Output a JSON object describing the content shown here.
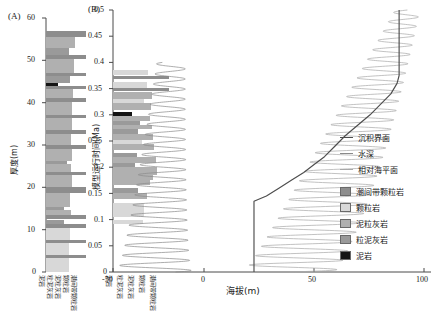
{
  "figure": {
    "panel_a": {
      "tag": "(A)",
      "ylabel": "厚度(m)",
      "yticks": [
        "0",
        "10",
        "20",
        "30",
        "40",
        "50",
        "60"
      ],
      "ylim": [
        0,
        60
      ],
      "bottom_labels": [
        "泥岩",
        "粒泥灰岩",
        "泥粒灰岩",
        "颗粒岩",
        "潮间带颗粒岩"
      ]
    },
    "panel_b": {
      "tag": "(B)",
      "ylabel": "模型运行时间(Ma)",
      "yticks": [
        "0",
        "0.05",
        "0.1",
        "0.15",
        "0.2",
        "0.25",
        "0.3",
        "0.35",
        "0.4",
        "0.45",
        "0.5"
      ],
      "ylim": [
        0,
        0.5
      ],
      "xlabel": "海拔(m)",
      "xticks": [
        "-50",
        "0",
        "50",
        "100"
      ],
      "xlim": [
        -50,
        100
      ],
      "bottom_labels": [
        "泥岩",
        "粒泥灰岩",
        "泥粒灰岩",
        "颗粒岩",
        "潮间带颗粒岩"
      ]
    },
    "legend": {
      "lines": [
        {
          "name": "sedimentary-interface",
          "label": "沉积界面",
          "color": "#4d4d4d"
        },
        {
          "name": "water-depth",
          "label": "水深",
          "color": "#8a8a8a"
        },
        {
          "name": "relative-sea-level",
          "label": "相对海平面",
          "color": "#a8a8a8"
        }
      ],
      "swatches": [
        {
          "name": "intertidal-grainstone",
          "label": "潮间带颗粒岩",
          "color": "#8d8d8d"
        },
        {
          "name": "grainstone",
          "label": "颗粒岩",
          "color": "#d8d8d8"
        },
        {
          "name": "packstone",
          "label": "泥粒灰岩",
          "color": "#b0b0b0"
        },
        {
          "name": "wackestone",
          "label": "粒泥灰岩",
          "color": "#9a9a9a"
        },
        {
          "name": "mudstone",
          "label": "泥岩",
          "color": "#141414"
        }
      ]
    }
  },
  "chart_data": {
    "type": "line",
    "title": "",
    "panels": [
      {
        "id": "A",
        "type": "lithology-column",
        "ylabel": "厚度(m)",
        "ylim": [
          0,
          60
        ],
        "xlabel": "",
        "description": "Stratigraphic thickness column of carbonate lithofacies versus thickness in metres.",
        "beds": [
          {
            "top": 57.0,
            "bottom": 55.5,
            "facies": "intertidal-grainstone",
            "width": 1.0
          },
          {
            "top": 55.5,
            "bottom": 53.0,
            "facies": "packstone",
            "width": 0.72
          },
          {
            "top": 53.0,
            "bottom": 51.2,
            "facies": "wackestone",
            "width": 0.58
          },
          {
            "top": 51.2,
            "bottom": 50.4,
            "facies": "intertidal-grainstone",
            "width": 1.0
          },
          {
            "top": 50.4,
            "bottom": 47.0,
            "facies": "packstone",
            "width": 0.7
          },
          {
            "top": 47.0,
            "bottom": 46.2,
            "facies": "intertidal-grainstone",
            "width": 1.0
          },
          {
            "top": 46.2,
            "bottom": 44.6,
            "facies": "wackestone",
            "width": 0.6
          },
          {
            "top": 44.6,
            "bottom": 44.0,
            "facies": "mudstone",
            "width": 0.3
          },
          {
            "top": 44.0,
            "bottom": 43.2,
            "facies": "intertidal-grainstone",
            "width": 1.0
          },
          {
            "top": 43.2,
            "bottom": 41.0,
            "facies": "packstone",
            "width": 0.68
          },
          {
            "top": 41.0,
            "bottom": 40.2,
            "facies": "intertidal-grainstone",
            "width": 1.0
          },
          {
            "top": 40.2,
            "bottom": 37.2,
            "facies": "packstone",
            "width": 0.66
          },
          {
            "top": 37.2,
            "bottom": 36.4,
            "facies": "intertidal-grainstone",
            "width": 1.0
          },
          {
            "top": 36.4,
            "bottom": 33.6,
            "facies": "packstone",
            "width": 0.64
          },
          {
            "top": 33.6,
            "bottom": 32.6,
            "facies": "intertidal-grainstone",
            "width": 1.0
          },
          {
            "top": 32.6,
            "bottom": 30.0,
            "facies": "packstone",
            "width": 0.62
          },
          {
            "top": 30.0,
            "bottom": 29.0,
            "facies": "intertidal-grainstone",
            "width": 1.0
          },
          {
            "top": 29.0,
            "bottom": 26.2,
            "facies": "packstone",
            "width": 0.66
          },
          {
            "top": 26.2,
            "bottom": 25.4,
            "facies": "wackestone",
            "width": 0.52
          },
          {
            "top": 25.4,
            "bottom": 23.6,
            "facies": "packstone",
            "width": 0.62
          },
          {
            "top": 23.6,
            "bottom": 22.8,
            "facies": "intertidal-grainstone",
            "width": 1.0
          },
          {
            "top": 22.8,
            "bottom": 20.0,
            "facies": "packstone",
            "width": 0.64
          },
          {
            "top": 20.0,
            "bottom": 18.6,
            "facies": "intertidal-grainstone",
            "width": 1.0
          },
          {
            "top": 18.6,
            "bottom": 15.4,
            "facies": "packstone",
            "width": 0.6
          },
          {
            "top": 15.4,
            "bottom": 14.6,
            "facies": "wackestone",
            "width": 0.46
          },
          {
            "top": 14.6,
            "bottom": 13.4,
            "facies": "packstone",
            "width": 0.62
          },
          {
            "top": 13.4,
            "bottom": 12.4,
            "facies": "intertidal-grainstone",
            "width": 1.0
          },
          {
            "top": 12.4,
            "bottom": 11.4,
            "facies": "wackestone",
            "width": 0.44
          },
          {
            "top": 11.4,
            "bottom": 10.4,
            "facies": "intertidal-grainstone",
            "width": 1.0
          },
          {
            "top": 10.4,
            "bottom": 7.6,
            "facies": "grainstone",
            "width": 0.6
          },
          {
            "top": 7.6,
            "bottom": 6.8,
            "facies": "intertidal-grainstone",
            "width": 1.0
          },
          {
            "top": 6.8,
            "bottom": 4.0,
            "facies": "grainstone",
            "width": 0.58
          },
          {
            "top": 4.0,
            "bottom": 3.2,
            "facies": "intertidal-grainstone",
            "width": 1.0
          },
          {
            "top": 3.2,
            "bottom": 0.0,
            "facies": "grainstone",
            "width": 0.58
          }
        ]
      },
      {
        "id": "B",
        "type": "line",
        "ylabel": "模型运行时间(Ma)",
        "ylim": [
          0,
          0.5
        ],
        "xlabel": "海拔(m)",
        "xlim": [
          -50,
          100
        ],
        "description": "Forward model output: water depth and relative sea level oscillations through model run time, with the stepped sedimentary interface and accompanying synthetic lithology column.",
        "series": [
          {
            "name": "相对海平面",
            "key": "relative-sea-level",
            "color": "#a8a8a8",
            "description": "Sinusoidal relative sea-level oscillation, amplitude decreasing upward, centred near 55-95 m elevation.",
            "cycles": 28,
            "amplitude_range": [
              6,
              22
            ],
            "center_start": 35,
            "center_end": 92
          },
          {
            "name": "水深",
            "key": "water-depth",
            "color": "#8a8a8a",
            "description": "Water-depth oscillation curve plotted about -35 to 0 m, amplitude increasing downward.",
            "cycles": 26,
            "amplitude_range": [
              5,
              18
            ],
            "center_start": -20,
            "center_end": -30
          },
          {
            "name": "沉积界面",
            "key": "sedimentary-interface",
            "color": "#4d4d4d",
            "description": "Stepped aggradational sedimentary interface rising from ~18 m at 0.14 Ma to ~88 m at 0.37 Ma then vertical to 0.5 Ma.",
            "points": [
              {
                "t": 0.0,
                "elev": 18
              },
              {
                "t": 0.135,
                "elev": 18
              },
              {
                "t": 0.145,
                "elev": 24
              },
              {
                "t": 0.16,
                "elev": 30
              },
              {
                "t": 0.175,
                "elev": 36
              },
              {
                "t": 0.19,
                "elev": 42
              },
              {
                "t": 0.205,
                "elev": 47
              },
              {
                "t": 0.22,
                "elev": 52
              },
              {
                "t": 0.24,
                "elev": 57
              },
              {
                "t": 0.26,
                "elev": 62
              },
              {
                "t": 0.28,
                "elev": 68
              },
              {
                "t": 0.3,
                "elev": 74
              },
              {
                "t": 0.32,
                "elev": 79
              },
              {
                "t": 0.34,
                "elev": 84
              },
              {
                "t": 0.36,
                "elev": 87
              },
              {
                "t": 0.375,
                "elev": 88
              },
              {
                "t": 0.5,
                "elev": 88
              }
            ]
          }
        ],
        "beds": [
          {
            "top": 0.385,
            "bottom": 0.375,
            "facies": "grainstone",
            "width": 0.62
          },
          {
            "top": 0.375,
            "bottom": 0.368,
            "facies": "intertidal-grainstone",
            "width": 1.0
          },
          {
            "top": 0.362,
            "bottom": 0.352,
            "facies": "grainstone",
            "width": 0.6
          },
          {
            "top": 0.352,
            "bottom": 0.346,
            "facies": "intertidal-grainstone",
            "width": 1.0
          },
          {
            "top": 0.344,
            "bottom": 0.33,
            "facies": "packstone",
            "width": 0.7
          },
          {
            "top": 0.33,
            "bottom": 0.322,
            "facies": "grainstone",
            "width": 0.55
          },
          {
            "top": 0.322,
            "bottom": 0.31,
            "facies": "packstone",
            "width": 0.68
          },
          {
            "top": 0.306,
            "bottom": 0.298,
            "facies": "mudstone",
            "width": 0.34
          },
          {
            "top": 0.298,
            "bottom": 0.288,
            "facies": "packstone",
            "width": 0.66
          },
          {
            "top": 0.288,
            "bottom": 0.28,
            "facies": "wackestone",
            "width": 0.48
          },
          {
            "top": 0.28,
            "bottom": 0.272,
            "facies": "packstone",
            "width": 0.7
          },
          {
            "top": 0.272,
            "bottom": 0.264,
            "facies": "wackestone",
            "width": 0.44
          },
          {
            "top": 0.264,
            "bottom": 0.252,
            "facies": "packstone",
            "width": 0.72
          },
          {
            "top": 0.252,
            "bottom": 0.244,
            "facies": "grainstone",
            "width": 0.52
          },
          {
            "top": 0.244,
            "bottom": 0.232,
            "facies": "packstone",
            "width": 0.74
          },
          {
            "top": 0.228,
            "bottom": 0.22,
            "facies": "wackestone",
            "width": 0.42
          },
          {
            "top": 0.22,
            "bottom": 0.208,
            "facies": "packstone",
            "width": 0.76
          },
          {
            "top": 0.208,
            "bottom": 0.2,
            "facies": "wackestone",
            "width": 0.4
          },
          {
            "top": 0.2,
            "bottom": 0.186,
            "facies": "packstone",
            "width": 0.78
          },
          {
            "top": 0.186,
            "bottom": 0.176,
            "facies": "packstone",
            "width": 0.72
          },
          {
            "top": 0.176,
            "bottom": 0.166,
            "facies": "packstone",
            "width": 0.66
          },
          {
            "top": 0.16,
            "bottom": 0.15,
            "facies": "wackestone",
            "width": 0.44
          },
          {
            "top": 0.15,
            "bottom": 0.14,
            "facies": "packstone",
            "width": 0.6
          },
          {
            "top": 0.132,
            "bottom": 0.104,
            "facies": "grainstone",
            "width": 0.56
          },
          {
            "top": 0.1,
            "bottom": 0.092,
            "facies": "grainstone",
            "width": 0.54
          }
        ]
      }
    ]
  }
}
